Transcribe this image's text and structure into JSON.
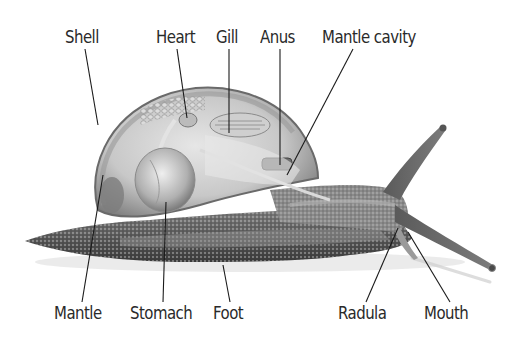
{
  "diagram": {
    "style": "grayscale illustration",
    "background": "#ffffff",
    "label_color": "#2a2a2a",
    "leader_line_color": "#1a1a1a"
  },
  "labels": {
    "top": [
      {
        "id": "shell",
        "text": "Shell"
      },
      {
        "id": "heart",
        "text": "Heart"
      },
      {
        "id": "gill",
        "text": "Gill"
      },
      {
        "id": "anus",
        "text": "Anus"
      },
      {
        "id": "mantle_cavity",
        "text": "Mantle cavity"
      }
    ],
    "bottom": [
      {
        "id": "mantle",
        "text": "Mantle"
      },
      {
        "id": "stomach",
        "text": "Stomach"
      },
      {
        "id": "foot",
        "text": "Foot"
      },
      {
        "id": "radula",
        "text": "Radula"
      },
      {
        "id": "mouth",
        "text": "Mouth"
      }
    ]
  }
}
